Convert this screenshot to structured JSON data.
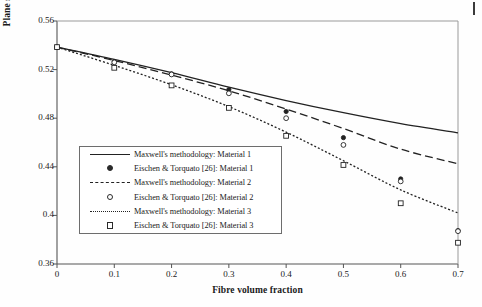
{
  "chart_data": {
    "type": "line",
    "title": "",
    "xlabel": "Fibre volume fraction",
    "ylabel": "Plane strain Poisson's ratio",
    "xlim": [
      0,
      0.7
    ],
    "ylim": [
      0.36,
      0.56
    ],
    "xticks": [
      "0",
      "0.1",
      "0.2",
      "0.3",
      "0.4",
      "0.5",
      "0.6",
      "0.7"
    ],
    "yticks": [
      "0.56",
      "0.52",
      "0.48",
      "0.44",
      "0.4",
      "0.36"
    ],
    "xtick_values": [
      0,
      0.1,
      0.2,
      0.3,
      0.4,
      0.5,
      0.6,
      0.7
    ],
    "ytick_values": [
      0.56,
      0.52,
      0.48,
      0.44,
      0.4,
      0.36
    ],
    "grid": false,
    "legend_position": "center-left",
    "series": [
      {
        "name": "Maxwell's methodology: Material 1",
        "style": "solid",
        "marker": "none",
        "x": [
          0,
          0.1,
          0.2,
          0.3,
          0.4,
          0.5,
          0.6,
          0.7
        ],
        "values": [
          0.5385,
          0.5285,
          0.5175,
          0.5055,
          0.4945,
          0.4845,
          0.4755,
          0.468
        ]
      },
      {
        "name": "Eischen & Torquato [26]: Material 1",
        "style": "none",
        "marker": "filled-circle",
        "x": [
          0,
          0.1,
          0.2,
          0.3,
          0.4,
          0.5,
          0.6,
          0.7
        ],
        "values": [
          0.5385,
          0.5265,
          0.5165,
          0.5035,
          0.4855,
          0.464,
          0.43,
          0.3875
        ]
      },
      {
        "name": "Maxwell's methodology: Material 2",
        "style": "dashed",
        "marker": "none",
        "x": [
          0,
          0.1,
          0.2,
          0.3,
          0.4,
          0.5,
          0.6,
          0.7
        ],
        "values": [
          0.5385,
          0.5275,
          0.5155,
          0.5025,
          0.4875,
          0.4715,
          0.4545,
          0.4425
        ]
      },
      {
        "name": "Eischen & Torquato [26]: Material 2",
        "style": "none",
        "marker": "open-circle",
        "x": [
          0,
          0.1,
          0.2,
          0.3,
          0.4,
          0.5,
          0.6,
          0.7
        ],
        "values": [
          0.5385,
          0.526,
          0.516,
          0.5005,
          0.48,
          0.458,
          0.428,
          0.387
        ]
      },
      {
        "name": "Maxwell's methodology: Material 3",
        "style": "dotted",
        "marker": "none",
        "x": [
          0,
          0.1,
          0.2,
          0.3,
          0.4,
          0.5,
          0.6,
          0.7
        ],
        "values": [
          0.5385,
          0.5235,
          0.5075,
          0.4895,
          0.4685,
          0.445,
          0.421,
          0.402
        ]
      },
      {
        "name": "Eischen & Torquato [26]: Material 3",
        "style": "none",
        "marker": "open-square",
        "x": [
          0,
          0.1,
          0.2,
          0.3,
          0.4,
          0.5,
          0.6,
          0.7
        ],
        "values": [
          0.5385,
          0.5215,
          0.507,
          0.4885,
          0.4655,
          0.4415,
          0.41,
          0.3775
        ]
      }
    ]
  },
  "axes": {
    "ylabel": "Plane strain Poisson's ratio",
    "xlabel": "Fibre volume fraction"
  },
  "legend": {
    "entries": [
      {
        "label": "Maxwell's methodology: Material 1",
        "key": "solid-line-key"
      },
      {
        "label": "Eischen & Torquato [26]: Material 1",
        "key": "filled-circle-marker-key"
      },
      {
        "label": "Maxwell's methodology: Material 2",
        "key": "dashed-line-key"
      },
      {
        "label": "Eischen & Torquato [26]: Material 2",
        "key": "open-circle-marker-key"
      },
      {
        "label": "Maxwell's methodology: Material 3",
        "key": "dotted-line-key"
      },
      {
        "label": "Eischen & Torquato [26]: Material 3",
        "key": "open-square-marker-key"
      }
    ]
  },
  "colors": {
    "line": "#222222",
    "axis": "#555555",
    "text": "#1a1a1a",
    "background": "#fefefe"
  }
}
